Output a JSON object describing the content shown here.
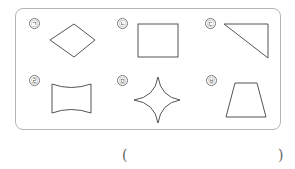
{
  "figures": [
    {
      "label": "㉠",
      "shape": "rhombus"
    },
    {
      "label": "㉡",
      "shape": "rectangle"
    },
    {
      "label": "㉢",
      "shape": "right-triangle"
    },
    {
      "label": "㉣",
      "shape": "concave-curved-quadrilateral"
    },
    {
      "label": "㉤",
      "shape": "four-pointed-star"
    },
    {
      "label": "㉥",
      "shape": "trapezoid"
    }
  ],
  "answer": {
    "open": "(",
    "close": ")",
    "value": ""
  },
  "colors": {
    "stroke": "#555555",
    "border": "#b5b5b5"
  }
}
